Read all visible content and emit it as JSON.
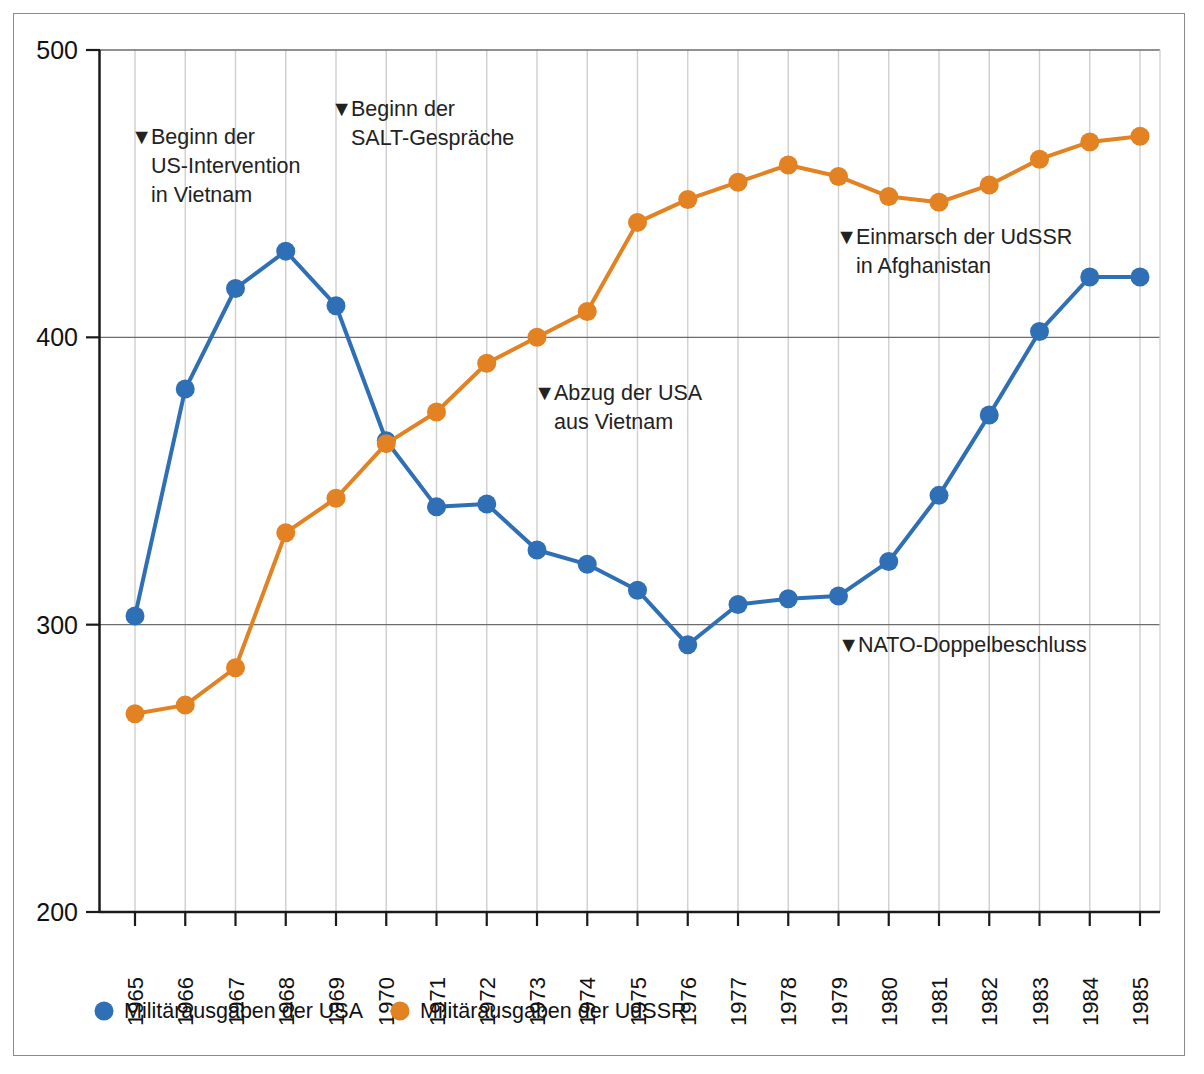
{
  "chart_data": {
    "type": "line",
    "title": "",
    "xlabel": "",
    "ylabel": "",
    "xlim": [
      1965,
      1985
    ],
    "ylim": [
      200,
      500
    ],
    "yticks": [
      200,
      300,
      400,
      500
    ],
    "grid": "vertical-per-year-plus-horizontal-at-y-ticks",
    "legend_position": "bottom-left",
    "categories": [
      "1965",
      "1966",
      "1967",
      "1968",
      "1969",
      "1970",
      "1971",
      "1972",
      "1973",
      "1974",
      "1975",
      "1976",
      "1977",
      "1978",
      "1979",
      "1980",
      "1981",
      "1982",
      "1983",
      "1984",
      "1985"
    ],
    "series": [
      {
        "name": "Militärausgaben der USA",
        "color": "#2f6fb5",
        "values": [
          303,
          382,
          417,
          430,
          411,
          364,
          341,
          342,
          326,
          321,
          312,
          293,
          307,
          309,
          310,
          322,
          345,
          373,
          402,
          421,
          421
        ]
      },
      {
        "name": "Militärausgaben der UdSSR",
        "color": "#e28222",
        "values": [
          269,
          272,
          285,
          332,
          344,
          363,
          374,
          391,
          400,
          409,
          440,
          448,
          454,
          460,
          456,
          449,
          447,
          453,
          462,
          468,
          470
        ]
      }
    ],
    "annotations": [
      {
        "id": "annot-us-intervention-vietnam",
        "marker": "▼",
        "lines": [
          "Beginn der",
          "US-Intervention",
          "in Vietnam"
        ],
        "anchor_x": 131,
        "anchor_y": 144
      },
      {
        "id": "annot-salt-talks",
        "marker": "▼",
        "lines": [
          "Beginn der",
          "SALT-Gespräche"
        ],
        "anchor_x": 331,
        "anchor_y": 116
      },
      {
        "id": "annot-us-withdrawal-vietnam",
        "marker": "▼",
        "lines": [
          "Abzug der USA",
          "aus Vietnam"
        ],
        "anchor_x": 534,
        "anchor_y": 400
      },
      {
        "id": "annot-ussr-afghanistan",
        "marker": "▼",
        "lines": [
          "Einmarsch der UdSSR",
          "in Afghanistan"
        ],
        "anchor_x": 836,
        "anchor_y": 244
      },
      {
        "id": "annot-nato-double-track",
        "marker": "▼",
        "lines": [
          "NATO-Doppelbeschluss"
        ],
        "anchor_x": 838,
        "anchor_y": 652
      }
    ]
  },
  "legend": {
    "items": [
      {
        "label": "Militärausgaben der USA",
        "color": "#2f6fb5"
      },
      {
        "label": "Militärausgaben der UdSSR",
        "color": "#e28222"
      }
    ]
  },
  "colors": {
    "usa": "#2f6fb5",
    "ussr": "#e28222",
    "axis": "#1a1a1a",
    "gridline_vertical": "#cfcfcf",
    "gridline_horizontal": "#6d6d6d",
    "frame": "#8a8a8a",
    "background": "#ffffff"
  }
}
